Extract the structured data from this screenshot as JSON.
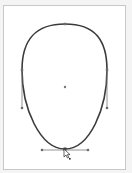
{
  "canvas": {
    "tool": "pen/direct-selection",
    "shape": "egg-shaped closed path",
    "stroke_color": "#3a3a3a",
    "handle_color": "#6b6b6b",
    "background": "#ffffff",
    "frame_border": "#c8c8c8"
  },
  "path": {
    "anchors": [
      {
        "name": "top",
        "x": 65,
        "y": 24
      },
      {
        "name": "left",
        "x": 22,
        "y": 70
      },
      {
        "name": "right",
        "x": 107,
        "y": 70
      },
      {
        "name": "bottom",
        "x": 65,
        "y": 149
      }
    ],
    "center_point": {
      "x": 65,
      "y": 87
    },
    "handles": [
      {
        "anchor": "left",
        "x1": 22,
        "y1": 70,
        "x2": 22,
        "y2": 108
      },
      {
        "anchor": "right",
        "x1": 107,
        "y1": 70,
        "x2": 107,
        "y2": 108
      },
      {
        "anchor": "bottom",
        "x1": 42,
        "y1": 150,
        "x2": 88,
        "y2": 150
      }
    ]
  },
  "cursor": {
    "icon": "arrow-cursor-with-anchor",
    "x": 65,
    "y": 150
  }
}
